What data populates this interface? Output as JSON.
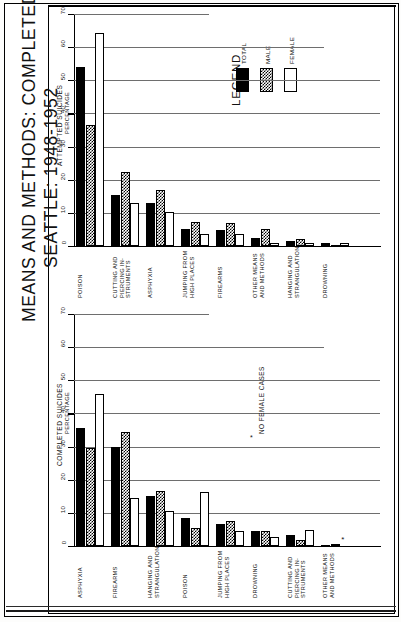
{
  "title": {
    "line1": "MEANS AND METHODS: COMPLETED AND ATTEMPTED SUICIDES",
    "line2": "SEATTLE: 1948-1952"
  },
  "legend": {
    "heading": "LEGEND",
    "items": [
      {
        "label": "TOTAL",
        "pattern": "solid-black"
      },
      {
        "label": "MALE",
        "pattern": "checkered"
      },
      {
        "label": "FEMALE",
        "pattern": "white"
      }
    ]
  },
  "footnote": {
    "star": "*",
    "text": "NO FEMALE CASES"
  },
  "chart_data": [
    {
      "type": "bar",
      "id": "attempted",
      "title": "",
      "ylabel": "ATTEMPTED SUICIDES",
      "ylabel2": "PERCENTAGE",
      "xlabel": "",
      "ylim": [
        0,
        70
      ],
      "yticks": [
        0,
        10,
        20,
        30,
        40,
        50,
        60,
        70
      ],
      "grid": true,
      "legend_position": "upper-right",
      "categories": [
        "POISON",
        "CUTTING AND PIERCING IN-STRUMENTS",
        "ASPHYXIA",
        "JUMPING FROM HIGH PLACES",
        "FIREARMS",
        "OTHER MEANS AND METHODS",
        "HANGING AND STRANGULATION",
        "DROWNING"
      ],
      "category_lines": [
        [
          "POISON"
        ],
        [
          "CUTTING  AND",
          "PIERCING IN-",
          "STRUMENTS"
        ],
        [
          "ASPHYXIA"
        ],
        [
          "JUMPING FROM",
          "HIGH  PLACES"
        ],
        [
          "FIREARMS"
        ],
        [
          "OTHER MEANS",
          "AND METHODS"
        ],
        [
          "HANGING  AND",
          "STRANGULATION"
        ],
        [
          "DROWNING"
        ]
      ],
      "series": [
        {
          "name": "TOTAL",
          "values": [
            54.0,
            15.5,
            13.0,
            5.0,
            4.8,
            2.3,
            1.5,
            0.9
          ]
        },
        {
          "name": "MALE",
          "values": [
            36.5,
            22.2,
            17.0,
            7.2,
            6.8,
            5.0,
            2.2,
            0.3
          ]
        },
        {
          "name": "FEMALE",
          "values": [
            64.3,
            13.0,
            10.3,
            3.7,
            3.7,
            0.8,
            0.9,
            0.9
          ]
        }
      ]
    },
    {
      "type": "bar",
      "id": "completed",
      "title": "",
      "ylabel": "COMPLETED SUICIDES",
      "ylabel2": "PERCENTAGE",
      "xlabel": "",
      "ylim": [
        0,
        70
      ],
      "yticks": [
        0,
        10,
        20,
        30,
        40,
        50,
        60,
        70
      ],
      "grid": true,
      "legend_position": "none",
      "categories": [
        "ASPHYXIA",
        "FIREARMS",
        "HANGING AND STRANGULATION",
        "POISON",
        "JUMPING FROM HIGH PLACES",
        "DROWNING",
        "CUTTING AND PIERCING IN-STRUMENTS",
        "OTHER MEANS AND METHODS"
      ],
      "category_lines": [
        [
          "ASPHYXIA"
        ],
        [
          "FIREARMS"
        ],
        [
          "HANGING  AND",
          "STRANGULATION"
        ],
        [
          "POISON"
        ],
        [
          "JUMPING FROM",
          "HIGH  PLACES"
        ],
        [
          "DROWNING"
        ],
        [
          "CUTTING  AND",
          "PIERCING IN-",
          "STRUMENTS"
        ],
        [
          "OTHER MEANS",
          "AND METHODS"
        ]
      ],
      "series": [
        {
          "name": "TOTAL",
          "values": [
            35.5,
            30.0,
            15.2,
            8.3,
            6.7,
            4.4,
            3.3,
            0.4
          ]
        },
        {
          "name": "MALE",
          "values": [
            29.5,
            34.5,
            16.5,
            5.5,
            7.4,
            4.4,
            1.9,
            0.5
          ]
        },
        {
          "name": "FEMALE",
          "values": [
            46.0,
            14.6,
            10.6,
            16.4,
            4.5,
            2.6,
            4.7,
            0.0
          ]
        }
      ],
      "annotations": [
        {
          "text": "*",
          "category": "OTHER MEANS AND METHODS",
          "series": "FEMALE",
          "meaning": "NO FEMALE CASES"
        }
      ]
    }
  ]
}
